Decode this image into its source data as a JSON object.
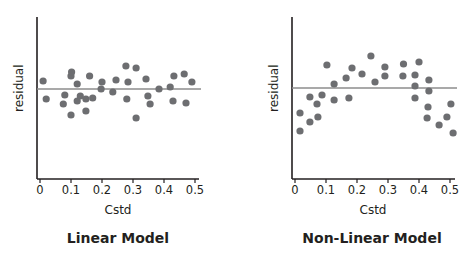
{
  "chart_data": [
    {
      "type": "scatter",
      "title": "Linear Model",
      "xlabel": "Cstd",
      "ylabel": "residual",
      "xlim": [
        0,
        0.5
      ],
      "xticks": [
        "0",
        "0.1",
        "0.2",
        "0.3",
        "0.4",
        "0.5"
      ],
      "reference_line_y": 0,
      "grid": false,
      "note": "residual in arbitrary units (positive = above zero line)",
      "points": [
        {
          "x": 0.01,
          "y": 8
        },
        {
          "x": 0.02,
          "y": -10
        },
        {
          "x": 0.075,
          "y": -15
        },
        {
          "x": 0.08,
          "y": -6
        },
        {
          "x": 0.1,
          "y": 13
        },
        {
          "x": 0.1,
          "y": -26
        },
        {
          "x": 0.102,
          "y": 17
        },
        {
          "x": 0.12,
          "y": 5
        },
        {
          "x": 0.12,
          "y": -12
        },
        {
          "x": 0.13,
          "y": -7
        },
        {
          "x": 0.148,
          "y": -10
        },
        {
          "x": 0.148,
          "y": -22
        },
        {
          "x": 0.16,
          "y": 13
        },
        {
          "x": 0.17,
          "y": -9
        },
        {
          "x": 0.197,
          "y": 0
        },
        {
          "x": 0.2,
          "y": 7
        },
        {
          "x": 0.235,
          "y": -3
        },
        {
          "x": 0.245,
          "y": 9
        },
        {
          "x": 0.277,
          "y": 23
        },
        {
          "x": 0.28,
          "y": -10
        },
        {
          "x": 0.284,
          "y": 7
        },
        {
          "x": 0.31,
          "y": 21
        },
        {
          "x": 0.31,
          "y": -29
        },
        {
          "x": 0.342,
          "y": 10
        },
        {
          "x": 0.348,
          "y": -7
        },
        {
          "x": 0.355,
          "y": -15
        },
        {
          "x": 0.384,
          "y": 0
        },
        {
          "x": 0.42,
          "y": 2
        },
        {
          "x": 0.429,
          "y": -12
        },
        {
          "x": 0.432,
          "y": 13
        },
        {
          "x": 0.465,
          "y": 15
        },
        {
          "x": 0.471,
          "y": -14
        },
        {
          "x": 0.49,
          "y": 7
        }
      ]
    },
    {
      "type": "scatter",
      "title": "Non-Linear Model",
      "xlabel": "Cstd",
      "ylabel": "residual",
      "xlim": [
        0,
        0.5
      ],
      "xticks": [
        "0",
        "0.1",
        "0.2",
        "0.3",
        "0.4",
        "0.5"
      ],
      "reference_line_y": 0,
      "grid": false,
      "note": "residual in arbitrary units (positive = above zero line)",
      "points": [
        {
          "x": 0.016,
          "y": -25
        },
        {
          "x": 0.016,
          "y": -43
        },
        {
          "x": 0.048,
          "y": -9
        },
        {
          "x": 0.048,
          "y": -34
        },
        {
          "x": 0.071,
          "y": -16
        },
        {
          "x": 0.074,
          "y": -29
        },
        {
          "x": 0.087,
          "y": -7
        },
        {
          "x": 0.103,
          "y": 23
        },
        {
          "x": 0.126,
          "y": 4
        },
        {
          "x": 0.126,
          "y": -12
        },
        {
          "x": 0.165,
          "y": 10
        },
        {
          "x": 0.174,
          "y": -10
        },
        {
          "x": 0.184,
          "y": 20
        },
        {
          "x": 0.216,
          "y": 14
        },
        {
          "x": 0.245,
          "y": 32
        },
        {
          "x": 0.258,
          "y": 6
        },
        {
          "x": 0.29,
          "y": 21
        },
        {
          "x": 0.29,
          "y": 12
        },
        {
          "x": 0.35,
          "y": 24
        },
        {
          "x": 0.348,
          "y": 12
        },
        {
          "x": 0.4,
          "y": 26
        },
        {
          "x": 0.387,
          "y": 13
        },
        {
          "x": 0.387,
          "y": 2
        },
        {
          "x": 0.387,
          "y": -10
        },
        {
          "x": 0.432,
          "y": 8
        },
        {
          "x": 0.432,
          "y": -3
        },
        {
          "x": 0.429,
          "y": -19
        },
        {
          "x": 0.426,
          "y": -30
        },
        {
          "x": 0.465,
          "y": -37
        },
        {
          "x": 0.49,
          "y": -29
        },
        {
          "x": 0.503,
          "y": -16
        },
        {
          "x": 0.51,
          "y": -45
        }
      ]
    }
  ],
  "panels": [
    {
      "title": "Linear Model",
      "xlabel": "Cstd",
      "ylabel": "residual"
    },
    {
      "title": "Non-Linear Model",
      "xlabel": "Cstd",
      "ylabel": "residual"
    }
  ],
  "colors": {
    "axis": "#231f20",
    "point": "#6d6e71",
    "refline": "#8c8c8c"
  }
}
